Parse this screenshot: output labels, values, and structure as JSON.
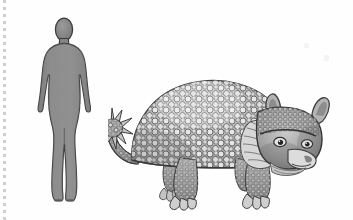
{
  "scene": {
    "title": "Glyptodon size comparison",
    "background_color": "#fefefe",
    "width": 353,
    "height": 220,
    "caption": ""
  },
  "margin_rule": {
    "name": "dotted-margin-line",
    "color": "#cfcfcf",
    "style": "dotted",
    "orientation": "vertical"
  },
  "human": {
    "label": "",
    "icon": "human-silhouette",
    "fill_color": "#8a8a8a",
    "outline_color": "#3a3a3a",
    "pose": "standing front view",
    "shading": "halftone"
  },
  "animal": {
    "label": "",
    "icon": "glyptodon-illustration",
    "common_name": "Glyptodon",
    "style": "pencil engraving",
    "ink_color": "#4a4a4a",
    "shell_color": "#b9b9b9",
    "features": {
      "carapace": "domed osteoderm shell",
      "tail": "spiked club tail",
      "head": "armored head cap",
      "legs": "four stout clawed limbs"
    },
    "facing": "right"
  },
  "specks": [
    {
      "name": "faint-mark-1"
    },
    {
      "name": "faint-mark-2"
    }
  ]
}
